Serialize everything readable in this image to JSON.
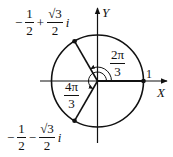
{
  "diagram": {
    "axes": {
      "x_label": "X",
      "y_label": "Y"
    },
    "unit_label": "1",
    "angles": [
      {
        "label_num": "2π",
        "label_den": "3",
        "degrees": 120
      },
      {
        "label_num": "4π",
        "label_den": "3",
        "degrees": 240
      }
    ],
    "points": [
      {
        "name": "upper-root",
        "sign1": "−",
        "a_num": "1",
        "a_den": "2",
        "sign2": "+",
        "b_num": "√3",
        "b_den": "2",
        "unit": "i"
      },
      {
        "name": "lower-root",
        "sign1": "−",
        "a_num": "1",
        "a_den": "2",
        "sign2": "−",
        "b_num": "√3",
        "b_den": "2",
        "unit": "i"
      },
      {
        "name": "unit-root",
        "value": "1"
      }
    ],
    "colors": {
      "stroke": "#111111",
      "background": "#ffffff"
    }
  }
}
